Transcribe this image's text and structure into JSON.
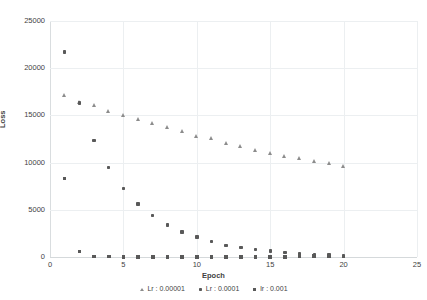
{
  "chart_data": {
    "type": "scatter",
    "title": "",
    "xlabel": "Epoch",
    "ylabel": "Loss",
    "xlim": [
      0,
      25
    ],
    "ylim": [
      0,
      25000
    ],
    "xticks": [
      0,
      5,
      10,
      15,
      20,
      25
    ],
    "yticks": [
      0,
      5000,
      10000,
      15000,
      20000,
      25000
    ],
    "xtick_labels": [
      "0",
      "5",
      "10",
      "15",
      "20",
      "25"
    ],
    "ytick_labels": [
      "0",
      "5000",
      "10000",
      "15000",
      "20000",
      "25000"
    ],
    "grid": true,
    "legend_position": "bottom",
    "x": [
      1,
      2,
      3,
      4,
      5,
      6,
      7,
      8,
      9,
      10,
      11,
      12,
      13,
      14,
      15,
      16,
      17,
      18,
      19,
      20
    ],
    "series": [
      {
        "name": "Lr : 0.00001",
        "marker": "triangle",
        "color": "#8c8c8c",
        "values": [
          17100,
          16350,
          16000,
          15450,
          14950,
          14600,
          14100,
          13700,
          13300,
          12800,
          12500,
          12050,
          11700,
          11300,
          11000,
          10650,
          10400,
          10100,
          9850,
          9600
        ]
      },
      {
        "name": "Lr : 0.0001",
        "marker": "diamond",
        "color": "#595959",
        "values": [
          21700,
          16300,
          12350,
          9500,
          7250,
          5600,
          4400,
          3400,
          2650,
          2100,
          1650,
          1250,
          1000,
          800,
          650,
          450,
          330,
          250,
          200,
          160
        ]
      },
      {
        "name": "lr : 0.001",
        "marker": "square",
        "color": "#595959",
        "values": [
          8300,
          600,
          60,
          40,
          30,
          25,
          20,
          20,
          18,
          15,
          15,
          12,
          12,
          10,
          10,
          10,
          120,
          110,
          60,
          60
        ]
      }
    ]
  },
  "axes": {
    "y_title": "Loss",
    "x_title": "Epoch"
  }
}
